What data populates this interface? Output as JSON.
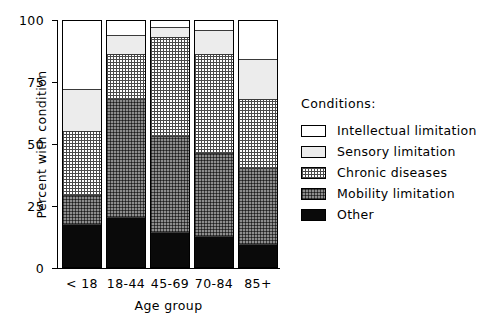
{
  "chart_data": {
    "type": "bar",
    "subtype": "stacked-bar-100",
    "title": "",
    "xlabel": "Age group",
    "ylabel": "Percent with condition",
    "ylim": [
      0,
      100
    ],
    "yticks": [
      0,
      25,
      50,
      75,
      100
    ],
    "ytick_labels": [
      "0",
      "25",
      "50",
      "75",
      "100"
    ],
    "grid": false,
    "legend_position": "right",
    "legend_title": "Conditions:",
    "categories": [
      "< 18",
      "18-44",
      "45-69",
      "70-84",
      "85+"
    ],
    "stack_order_bottom_to_top": [
      "Other",
      "Mobility limitation",
      "Chronic diseases",
      "Sensory limitation",
      "Intellectual limitation"
    ],
    "series": [
      {
        "name": "Other",
        "pattern": "solid-black",
        "values": [
          17,
          20,
          14,
          12,
          9
        ]
      },
      {
        "name": "Mobility limitation",
        "pattern": "dense-gray-grid",
        "values": [
          12,
          48,
          39,
          34,
          31
        ]
      },
      {
        "name": "Chronic diseases",
        "pattern": "fine-grid",
        "values": [
          26,
          18,
          40,
          40,
          28
        ]
      },
      {
        "name": "Sensory limitation",
        "pattern": "light-gray",
        "values": [
          17,
          8,
          4,
          10,
          16
        ]
      },
      {
        "name": "Intellectual limitation",
        "pattern": "white",
        "values": [
          28,
          6,
          3,
          4,
          16
        ]
      }
    ],
    "cumulative_tops": {
      "< 18": [
        17,
        29,
        55,
        72,
        100
      ],
      "18-44": [
        20,
        68,
        86,
        94,
        100
      ],
      "45-69": [
        14,
        53,
        93,
        97,
        100
      ],
      "70-84": [
        12,
        46,
        86,
        96,
        100
      ],
      "85+": [
        9,
        40,
        68,
        84,
        100
      ]
    }
  },
  "legend": {
    "title": "Conditions:",
    "entries": [
      {
        "label": "Intellectual limitation",
        "swatch": "white-swatch"
      },
      {
        "label": "Sensory limitation",
        "swatch": "light-gray-swatch"
      },
      {
        "label": "Chronic diseases",
        "swatch": "fine-grid-swatch"
      },
      {
        "label": "Mobility limitation",
        "swatch": "dense-gray-grid-swatch"
      },
      {
        "label": "Other",
        "swatch": "black-swatch"
      }
    ]
  },
  "colors": {
    "axis": "#000000",
    "other": "#0a0a0a",
    "mobility": "#8d8d8d",
    "chronic": "#ffffff",
    "sensory": "#ececec",
    "intellectual": "#ffffff",
    "background": "#ffffff"
  }
}
